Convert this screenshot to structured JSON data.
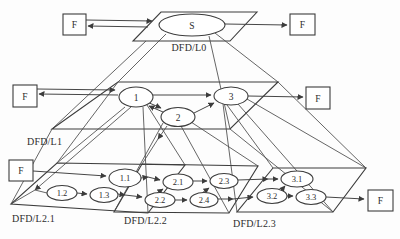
{
  "diagram": {
    "type": "dfd-leveling-pyramid",
    "levels": {
      "l0": {
        "label": "DFD/L0",
        "process_s": "S"
      },
      "l1": {
        "label": "DFD/L1",
        "p1": "1",
        "p2": "2",
        "p3": "3"
      },
      "l2_1": {
        "label": "DFD/L2.1",
        "p11": "1.1",
        "p12": "1.2",
        "p13": "1.3"
      },
      "l2_2": {
        "label": "DFD/L2.2",
        "p21": "2.1",
        "p22": "2.2",
        "p23": "2.3",
        "p24": "2.4"
      },
      "l2_3": {
        "label": "DFD/L2.3",
        "p31": "3.1",
        "p32": "3.2",
        "p33": "3.3"
      }
    },
    "externals": {
      "top_left": "F",
      "top_right": "F",
      "mid_left": "F",
      "mid_right": "F",
      "bottom_left": "F",
      "bottom_right": "F"
    },
    "colors": {
      "line": "#3c3c3c",
      "node_fill": "#ffffff",
      "background": "#fdfdfd",
      "text": "#2d2d2d"
    }
  }
}
